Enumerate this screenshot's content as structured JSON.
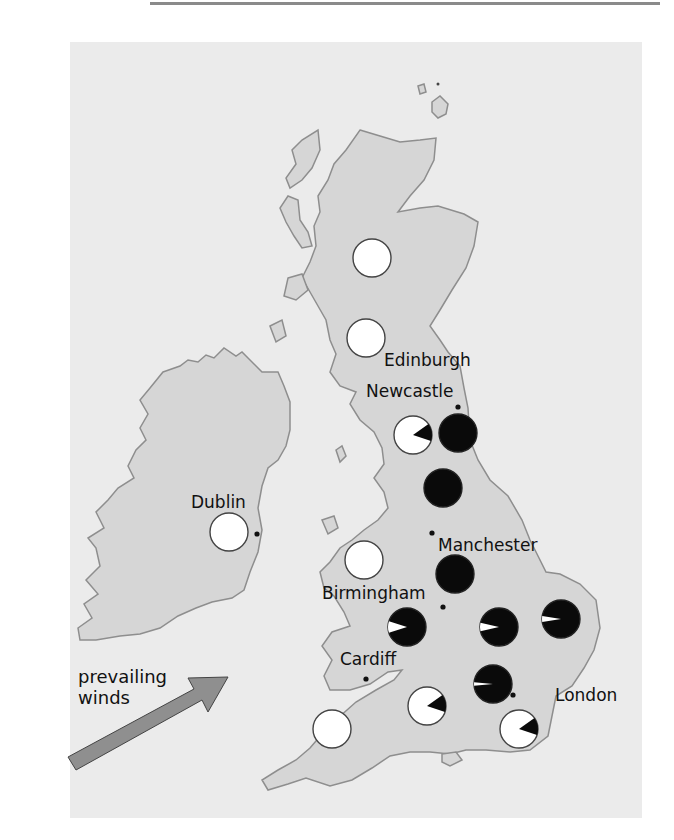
{
  "figure": {
    "type": "map",
    "title": "",
    "region": "British Isles",
    "legend": {
      "white": "unpolluted / pale form",
      "black": "polluted / dark form"
    }
  },
  "cities": [
    {
      "name": "Edinburgh",
      "dot": [
        380,
        346
      ],
      "label": [
        384,
        352
      ]
    },
    {
      "name": "Newcastle",
      "dot": [
        458,
        407
      ],
      "label": [
        366,
        382
      ]
    },
    {
      "name": "Dublin",
      "dot": [
        257,
        534
      ],
      "label": [
        191,
        494
      ]
    },
    {
      "name": "Manchester",
      "dot": [
        432,
        533
      ],
      "label": [
        438,
        536
      ]
    },
    {
      "name": "Birmingham",
      "dot": [
        443,
        607
      ],
      "label": [
        322,
        584
      ]
    },
    {
      "name": "Cardiff",
      "dot": [
        366,
        679
      ],
      "label": [
        340,
        650
      ]
    },
    {
      "name": "London",
      "dot": [
        513,
        695
      ],
      "label": [
        555,
        686
      ]
    }
  ],
  "annotation": {
    "line1": "prevailing",
    "line2": "winds"
  },
  "colors": {
    "panel": "#ebebeb",
    "land": "#d6d6d6",
    "coast": "#8e8e8e",
    "pie_dark": "#0a0a0a",
    "pie_light": "#ffffff",
    "arrow": "#8f8f8f"
  },
  "chart_data": {
    "type": "pie",
    "note": "Each circle is a pie chart; dark fraction = proportion of melanic (dark) form. Positions in screenshot pixels.",
    "series": [
      {
        "site": "N Scotland",
        "cx": 372,
        "cy": 258,
        "dark_fraction": 0.0
      },
      {
        "site": "S Scotland",
        "cx": 366,
        "cy": 338,
        "dark_fraction": 0.0
      },
      {
        "site": "Cumbria (W of Newcastle)",
        "cx": 413,
        "cy": 435,
        "dark_fraction": 0.15
      },
      {
        "site": "Newcastle",
        "cx": 458,
        "cy": 433,
        "dark_fraction": 1.0
      },
      {
        "site": "Yorkshire",
        "cx": 443,
        "cy": 488,
        "dark_fraction": 1.0
      },
      {
        "site": "Dublin",
        "cx": 229,
        "cy": 532,
        "dark_fraction": 0.0
      },
      {
        "site": "North Wales",
        "cx": 364,
        "cy": 560,
        "dark_fraction": 0.0
      },
      {
        "site": "Manchester",
        "cx": 455,
        "cy": 574,
        "dark_fraction": 1.0
      },
      {
        "site": "Birmingham W",
        "cx": 407,
        "cy": 627,
        "dark_fraction": 0.9
      },
      {
        "site": "Midlands E",
        "cx": 499,
        "cy": 627,
        "dark_fraction": 0.93
      },
      {
        "site": "East Anglia",
        "cx": 561,
        "cy": 619,
        "dark_fraction": 0.95
      },
      {
        "site": "London N",
        "cx": 493,
        "cy": 684,
        "dark_fraction": 0.97
      },
      {
        "site": "Somerset",
        "cx": 427,
        "cy": 706,
        "dark_fraction": 0.15
      },
      {
        "site": "Cornwall",
        "cx": 332,
        "cy": 729,
        "dark_fraction": 0.0
      },
      {
        "site": "Sussex",
        "cx": 519,
        "cy": 729,
        "dark_fraction": 0.15
      }
    ]
  }
}
